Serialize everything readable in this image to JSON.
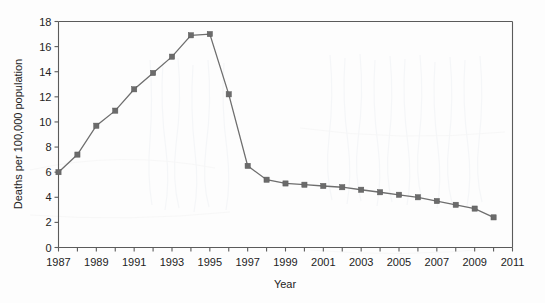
{
  "chart_data": {
    "type": "line",
    "title": "",
    "subtitle": "",
    "xlabel": "Year",
    "ylabel": "Deaths per 100,000 population",
    "xlim": [
      1987,
      2011
    ],
    "ylim": [
      0,
      18
    ],
    "ytick_step": 2,
    "xtick_step_minor": 1,
    "xtick_step_major": 2,
    "grid": false,
    "legend": false,
    "legend_position": "none",
    "marker": "square",
    "series_color": "#6e6e6e",
    "marker_color": "#6b6b6b",
    "axis_color": "#5b5b5b",
    "background_color": "#fdfdfd",
    "x": [
      1987,
      1988,
      1989,
      1990,
      1991,
      1992,
      1993,
      1994,
      1995,
      1996,
      1997,
      1998,
      1999,
      2000,
      2001,
      2002,
      2003,
      2004,
      2005,
      2006,
      2007,
      2008,
      2009,
      2010
    ],
    "values": [
      6.0,
      7.4,
      9.7,
      10.9,
      12.6,
      13.9,
      15.2,
      16.9,
      17.0,
      12.2,
      6.5,
      5.4,
      5.1,
      5.0,
      4.9,
      4.8,
      4.6,
      4.4,
      4.2,
      4.0,
      3.7,
      3.4,
      3.1,
      2.4
    ],
    "xtick_labels": [
      "1987",
      "1989",
      "1991",
      "1993",
      "1995",
      "1997",
      "1999",
      "2001",
      "2003",
      "2005",
      "2007",
      "2009",
      "2011"
    ],
    "xtick_values": [
      1987,
      1989,
      1991,
      1993,
      1995,
      1997,
      1999,
      2001,
      2003,
      2005,
      2007,
      2009,
      2011
    ],
    "xtick_minor_values": [
      1988,
      1990,
      1992,
      1994,
      1996,
      1998,
      2000,
      2002,
      2004,
      2006,
      2008,
      2010
    ],
    "ytick_labels": [
      "0",
      "2",
      "4",
      "6",
      "8",
      "10",
      "12",
      "14",
      "16",
      "18"
    ],
    "ytick_values": [
      0,
      2,
      4,
      6,
      8,
      10,
      12,
      14,
      16,
      18
    ],
    "annotations": []
  }
}
